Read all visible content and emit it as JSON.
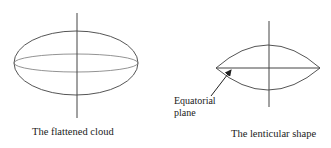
{
  "figures": [
    {
      "id": "flattened-cloud",
      "caption": "The flattened cloud",
      "shape": {
        "type": "ellipse",
        "cx": 76,
        "cy": 63,
        "rx": 62,
        "ry": 32
      },
      "equator": {
        "type": "ellipse",
        "cx": 76,
        "cy": 63,
        "rx": 62,
        "ry": 9
      },
      "axis": {
        "x": 77,
        "y1": 13,
        "y2": 118
      }
    },
    {
      "id": "lenticular-shape",
      "caption": "The lenticular shape",
      "annotation": {
        "line1": "Equatorial",
        "line2": "plane"
      },
      "lens": {
        "left_tip": [
          216,
          68
        ],
        "right_tip": [
          320,
          68
        ],
        "top_y": 45,
        "bottom_y": 90
      },
      "axis": {
        "x": 269,
        "y1": 21,
        "y2": 107
      }
    }
  ],
  "colors": {
    "stroke": "#555555",
    "text": "#222222"
  }
}
